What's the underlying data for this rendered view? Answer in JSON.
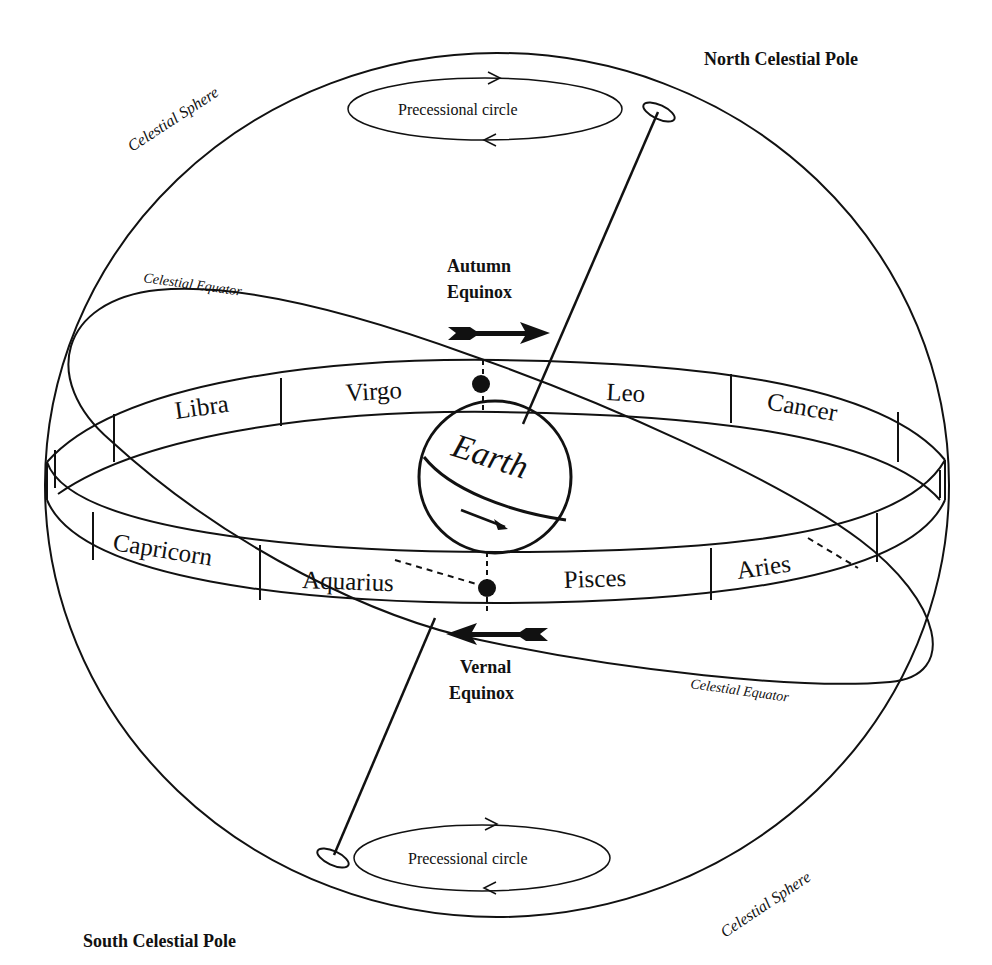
{
  "labels": {
    "north_pole": "North Celestial Pole",
    "south_pole": "South Celestial Pole",
    "celestial_sphere_top": "Celestial Sphere",
    "celestial_sphere_bottom": "Celestial Sphere",
    "celestial_equator_top": "Celestial Equator",
    "celestial_equator_bottom": "Celestial Equator",
    "precessional_circle_top": "Precessional circle",
    "precessional_circle_bottom": "Precessional circle",
    "autumn_equinox_line1": "Autumn",
    "autumn_equinox_line2": "Equinox",
    "vernal_equinox_line1": "Vernal",
    "vernal_equinox_line2": "Equinox",
    "earth": "Earth"
  },
  "zodiac": {
    "back": [
      "Libra",
      "Virgo",
      "Leo",
      "Cancer"
    ],
    "front": [
      "Capricorn",
      "Aquarius",
      "Pisces",
      "Aries"
    ]
  },
  "colors": {
    "ink": "#111111",
    "background": "#ffffff"
  }
}
